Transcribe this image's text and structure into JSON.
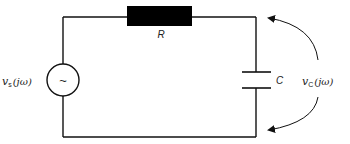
{
  "diagram": {
    "type": "RC circuit",
    "colors": {
      "stroke": "#111111",
      "resistor_fill": "#000000",
      "background": "#ffffff"
    },
    "components": {
      "source": {
        "symbol": "~",
        "label_main": "v",
        "label_sub": "s",
        "label_arg": "(jω)"
      },
      "resistor": {
        "label": "R"
      },
      "capacitor": {
        "label": "C"
      }
    },
    "output": {
      "label_main": "v",
      "label_sub": "C",
      "label_arg": "(jω)"
    }
  }
}
